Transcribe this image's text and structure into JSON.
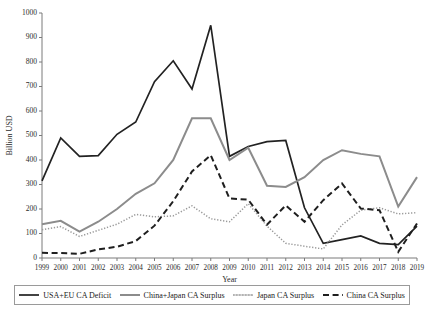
{
  "chart_data": {
    "type": "line",
    "title": "",
    "xlabel": "Year",
    "ylabel": "Billion USD",
    "grid": false,
    "legend_position": "bottom",
    "xlim": [
      1999,
      2019
    ],
    "ylim": [
      0,
      1000
    ],
    "ytick_labels": [
      "0",
      "100",
      "200",
      "300",
      "400",
      "500",
      "600",
      "700",
      "800",
      "900",
      "1000"
    ],
    "ytick_values": [
      0,
      100,
      200,
      300,
      400,
      500,
      600,
      700,
      800,
      900,
      1000
    ],
    "categories": [
      1999,
      2000,
      2001,
      2002,
      2003,
      2004,
      2005,
      2006,
      2007,
      2008,
      2009,
      2010,
      2011,
      2012,
      2013,
      2014,
      2015,
      2016,
      2017,
      2018,
      2019
    ],
    "xtick_labels": [
      "1999",
      "2000",
      "2001",
      "2002",
      "2003",
      "2004",
      "2005",
      "2006",
      "2007",
      "2008",
      "2009",
      "2010",
      "2011",
      "2012",
      "2013",
      "2014",
      "2015",
      "2016",
      "2017",
      "2018",
      "2019"
    ],
    "series": [
      {
        "name": "USA+EU CA Deficit",
        "style": "solid",
        "color": "#222222",
        "width": 1.7,
        "values": [
          315,
          490,
          415,
          418,
          505,
          555,
          720,
          805,
          690,
          950,
          415,
          455,
          475,
          480,
          205,
          60,
          75,
          90,
          60,
          55,
          130
        ]
      },
      {
        "name": "China+Japan CA Surplus",
        "style": "solid",
        "color": "#8c8c8c",
        "width": 2.0,
        "values": [
          138,
          152,
          108,
          148,
          200,
          262,
          305,
          400,
          570,
          570,
          400,
          450,
          295,
          290,
          330,
          400,
          440,
          425,
          415,
          210,
          330
        ]
      },
      {
        "name": "Japan CA Surplus",
        "style": "dotted",
        "color": "#9a9a9a",
        "width": 1.5,
        "values": [
          115,
          128,
          88,
          113,
          138,
          178,
          168,
          172,
          213,
          160,
          148,
          222,
          130,
          60,
          48,
          37,
          135,
          195,
          205,
          180,
          185
        ]
      },
      {
        "name": "China CA Surplus",
        "style": "dashed",
        "color": "#1f1f1f",
        "width": 2.0,
        "values": [
          21,
          20,
          17,
          35,
          46,
          69,
          132,
          232,
          353,
          420,
          243,
          238,
          136,
          215,
          148,
          236,
          304,
          202,
          195,
          25,
          141
        ]
      }
    ]
  },
  "legend": {
    "items": [
      {
        "label": "USA+EU CA Deficit",
        "swatch": "solid-black-line-swatch"
      },
      {
        "label": "China+Japan CA Surplus",
        "swatch": "solid-gray-line-swatch"
      },
      {
        "label": "Japan CA Surplus",
        "swatch": "dotted-gray-line-swatch"
      },
      {
        "label": "China CA Surplus",
        "swatch": "dashed-black-line-swatch"
      }
    ]
  }
}
